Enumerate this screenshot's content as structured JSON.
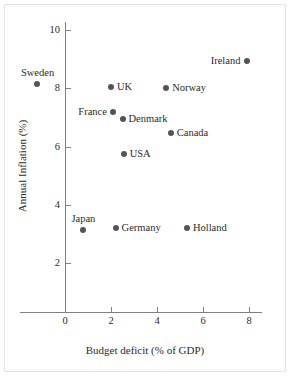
{
  "chart_data": {
    "type": "scatter",
    "title": "",
    "xlabel": "Budget deficit (% of GDP)",
    "ylabel": "Annual Inflation (%)",
    "xlim": [
      -2,
      9
    ],
    "ylim": [
      0,
      10.6
    ],
    "grid": false,
    "legend": "none",
    "xticks": [
      "0",
      "2",
      "4",
      "6",
      "8"
    ],
    "xtick_values": [
      0,
      2,
      4,
      6,
      8
    ],
    "yticks": [
      "2",
      "4",
      "6",
      "8",
      "10"
    ],
    "ytick_values": [
      2,
      4,
      6,
      8,
      10
    ],
    "points": [
      {
        "label": "Sweden",
        "x": -1.2,
        "y": 8.15,
        "label_pos": "above"
      },
      {
        "label": "Ireland",
        "x": 7.9,
        "y": 8.95,
        "label_pos": "left"
      },
      {
        "label": "UK",
        "x": 2.0,
        "y": 8.05,
        "label_pos": "right"
      },
      {
        "label": "Norway",
        "x": 4.4,
        "y": 8.0,
        "label_pos": "right"
      },
      {
        "label": "France",
        "x": 2.1,
        "y": 7.2,
        "label_pos": "left"
      },
      {
        "label": "Denmark",
        "x": 2.5,
        "y": 6.95,
        "label_pos": "right"
      },
      {
        "label": "Canada",
        "x": 4.6,
        "y": 6.45,
        "label_pos": "right"
      },
      {
        "label": "USA",
        "x": 2.55,
        "y": 5.75,
        "label_pos": "right"
      },
      {
        "label": "Japan",
        "x": 0.8,
        "y": 3.15,
        "label_pos": "above"
      },
      {
        "label": "Germany",
        "x": 2.2,
        "y": 3.2,
        "label_pos": "right"
      },
      {
        "label": "Holland",
        "x": 5.3,
        "y": 3.2,
        "label_pos": "right"
      }
    ],
    "marker_color": "#555555",
    "axis_color": "#808080",
    "text_color": "#2b2b2b"
  }
}
